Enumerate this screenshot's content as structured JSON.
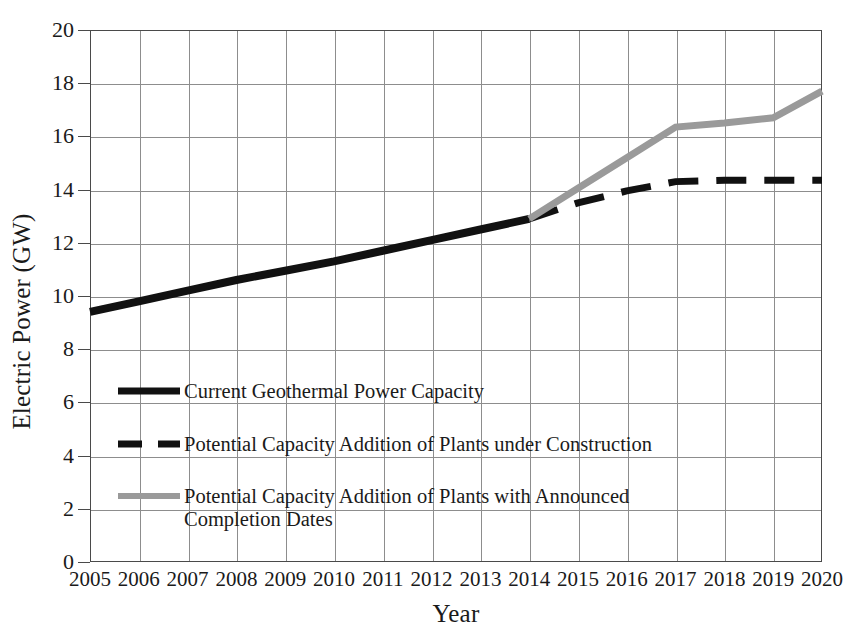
{
  "chart_data": {
    "type": "line",
    "title": "",
    "xlabel": "Year",
    "ylabel": "Electric Power (GW)",
    "xlim": [
      2005,
      2020
    ],
    "ylim": [
      0,
      20
    ],
    "grid": true,
    "legend_position": "inside-lower-left",
    "x_ticks": [
      "2005",
      "2006",
      "2007",
      "2008",
      "2009",
      "2010",
      "2011",
      "2012",
      "2013",
      "2014",
      "2015",
      "2016",
      "2017",
      "2018",
      "2019",
      "2020"
    ],
    "y_ticks": [
      "0",
      "2",
      "4",
      "6",
      "8",
      "10",
      "12",
      "14",
      "16",
      "18",
      "20"
    ],
    "series": [
      {
        "name": "Current Geothermal Power Capacity",
        "style": "solid",
        "color": "#111111",
        "width": 8,
        "x": [
          2005,
          2006,
          2007,
          2008,
          2009,
          2010,
          2011,
          2012,
          2013,
          2014
        ],
        "values": [
          9.4,
          9.8,
          10.2,
          10.6,
          10.95,
          11.3,
          11.7,
          12.1,
          12.5,
          12.9
        ]
      },
      {
        "name": "Potential Capacity Addition of Plants under Construction",
        "style": "dashed",
        "color": "#111111",
        "width": 7,
        "x": [
          2014,
          2015,
          2016,
          2017,
          2018,
          2019,
          2020
        ],
        "values": [
          12.9,
          13.5,
          13.95,
          14.3,
          14.35,
          14.35,
          14.35
        ]
      },
      {
        "name": "Potential Capacity Addition of Plants with Announced Completion Dates",
        "style": "solid",
        "color": "#9a9a9a",
        "width": 7,
        "x": [
          2014,
          2015,
          2016,
          2017,
          2018,
          2019,
          2020
        ],
        "values": [
          12.9,
          14.05,
          15.2,
          16.35,
          16.5,
          16.7,
          17.7
        ]
      }
    ]
  },
  "legend": {
    "entries": [
      {
        "label": "Current Geothermal Power Capacity",
        "swatch": "solid-black-line-icon"
      },
      {
        "label": "Potential Capacity Addition of Plants under Construction",
        "swatch": "dashed-black-line-icon"
      },
      {
        "label": "Potential Capacity Addition of Plants with Announced Completion Dates",
        "swatch": "solid-gray-line-icon"
      }
    ]
  },
  "axes": {
    "x_title": "Year",
    "y_title": "Electric Power (GW)"
  }
}
